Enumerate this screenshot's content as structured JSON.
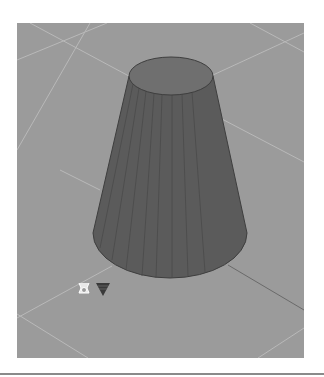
{
  "viewport": {
    "background": "#9b9b9b",
    "grid_color": "#b9b9b9",
    "axis_color": "#6a6a6a",
    "model": {
      "type": "cone-frustum",
      "top_face_color": "#6f6f6f",
      "side_color": "#5b5b5b",
      "edge_color": "#3e3e3e",
      "facet_color": "#4a4a4a"
    }
  },
  "icons": {
    "origin_marker": "origin-gizmo-icon",
    "section_marker": "triangle-down-icon"
  }
}
